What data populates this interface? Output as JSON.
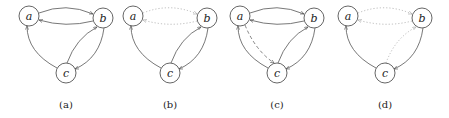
{
  "figure": {
    "panels": [
      {
        "id": "a",
        "caption": "(a)",
        "offset": 0,
        "nodes": {
          "a": "a",
          "b": "b",
          "c": "c"
        },
        "edges": {
          "ab": "solid",
          "ba": "solid",
          "ca": "solid",
          "cb": "solid",
          "bc": "solid",
          "ac": "none"
        }
      },
      {
        "id": "b",
        "caption": "(b)",
        "offset": 104,
        "nodes": {
          "a": "a",
          "b": "b",
          "c": "c"
        },
        "edges": {
          "ab": "dotted",
          "ba": "dotted",
          "ca": "solid",
          "cb": "solid",
          "bc": "solid",
          "ac": "none"
        }
      },
      {
        "id": "c",
        "caption": "(c)",
        "offset": 211,
        "nodes": {
          "a": "a",
          "b": "b",
          "c": "c"
        },
        "edges": {
          "ab": "solid",
          "ba": "solid",
          "ca": "solid",
          "cb": "solid",
          "bc": "solid",
          "ac": "dashed"
        }
      },
      {
        "id": "d",
        "caption": "(d)",
        "offset": 319,
        "nodes": {
          "a": "a",
          "b": "b",
          "c": "c"
        },
        "edges": {
          "ab": "dotted",
          "ba": "dotted",
          "ca": "solid",
          "cb": "dotted",
          "bc": "solid",
          "ac": "none"
        }
      }
    ]
  }
}
